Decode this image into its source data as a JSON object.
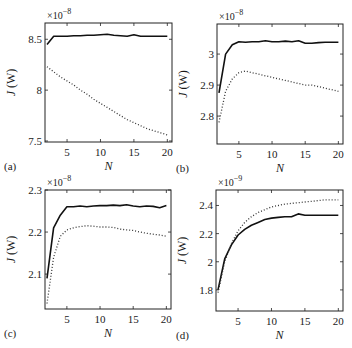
{
  "chart_data": [
    {
      "panel": "(a)",
      "type": "line",
      "xlabel": "N",
      "ylabel": "J (W)",
      "scale_label": "×10^-8",
      "scale_base": "×10",
      "scale_exp": "−8",
      "xlim": [
        1.7,
        20.7
      ],
      "ylim": [
        7.49,
        8.66
      ],
      "xticks": [
        5,
        10,
        15,
        20
      ],
      "yticks": [
        7.5,
        8,
        8.5
      ],
      "ytick_labels": [
        "7.5",
        "8",
        "8.5"
      ],
      "box": [
        45,
        23,
        172,
        142
      ],
      "series": [
        {
          "name": "solid",
          "style": "solid",
          "x": [
            2,
            3,
            4,
            5,
            6,
            7,
            8,
            9,
            10,
            11,
            12,
            13,
            14,
            15,
            16,
            17,
            18,
            19,
            20
          ],
          "values": [
            8.45,
            8.53,
            8.53,
            8.53,
            8.535,
            8.535,
            8.54,
            8.54,
            8.545,
            8.55,
            8.54,
            8.535,
            8.53,
            8.545,
            8.53,
            8.53,
            8.53,
            8.53,
            8.53
          ]
        },
        {
          "name": "dotted",
          "style": "dotted",
          "x": [
            2,
            3,
            4,
            5,
            6,
            7,
            8,
            9,
            10,
            11,
            12,
            13,
            14,
            15,
            16,
            17,
            18,
            19,
            20
          ],
          "values": [
            8.23,
            8.18,
            8.13,
            8.09,
            8.05,
            8.0,
            7.96,
            7.91,
            7.87,
            7.83,
            7.79,
            7.75,
            7.71,
            7.68,
            7.65,
            7.62,
            7.6,
            7.58,
            7.56
          ]
        }
      ]
    },
    {
      "panel": "(b)",
      "type": "line",
      "xlabel": "N",
      "ylabel": "J (W)",
      "scale_label": "×10^-8",
      "scale_base": "×10",
      "scale_exp": "−8",
      "xlim": [
        1.7,
        20.7
      ],
      "ylim": [
        2.71,
        3.097
      ],
      "xticks": [
        5,
        10,
        15,
        20
      ],
      "yticks": [
        2.8,
        2.9,
        3.0
      ],
      "ytick_labels": [
        "2.8",
        "2.9",
        "3"
      ],
      "box": [
        217,
        24,
        343,
        144
      ],
      "series": [
        {
          "name": "solid",
          "style": "solid",
          "x": [
            2,
            3,
            4,
            5,
            6,
            7,
            8,
            9,
            10,
            11,
            12,
            13,
            14,
            15,
            16,
            17,
            18,
            19,
            20
          ],
          "values": [
            2.875,
            3.0,
            3.03,
            3.04,
            3.038,
            3.04,
            3.04,
            3.043,
            3.04,
            3.04,
            3.042,
            3.04,
            3.043,
            3.035,
            3.035,
            3.037,
            3.038,
            3.038,
            3.038
          ]
        },
        {
          "name": "dotted",
          "style": "dotted",
          "x": [
            2,
            3,
            4,
            5,
            6,
            7,
            8,
            9,
            10,
            11,
            12,
            13,
            14,
            15,
            16,
            17,
            18,
            19,
            20
          ],
          "values": [
            2.78,
            2.88,
            2.92,
            2.94,
            2.945,
            2.94,
            2.935,
            2.93,
            2.925,
            2.92,
            2.915,
            2.91,
            2.905,
            2.9,
            2.9,
            2.895,
            2.89,
            2.885,
            2.88
          ]
        }
      ]
    },
    {
      "panel": "(c)",
      "type": "line",
      "xlabel": "N",
      "ylabel": "J (W)",
      "scale_label": "×10^-8",
      "scale_base": "×10",
      "scale_exp": "−8",
      "xlim": [
        1.7,
        20.7
      ],
      "ylim": [
        2.017,
        2.3
      ],
      "xticks": [
        5,
        10,
        15,
        20
      ],
      "yticks": [
        2.1,
        2.2,
        2.3
      ],
      "ytick_labels": [
        "2.1",
        "2.2",
        "2.3"
      ],
      "box": [
        45,
        190,
        171,
        309
      ],
      "series": [
        {
          "name": "solid",
          "style": "solid",
          "x": [
            2,
            3,
            4,
            5,
            6,
            7,
            8,
            9,
            10,
            11,
            12,
            13,
            14,
            15,
            16,
            17,
            18,
            19,
            20
          ],
          "values": [
            2.09,
            2.21,
            2.24,
            2.26,
            2.26,
            2.262,
            2.26,
            2.262,
            2.263,
            2.263,
            2.264,
            2.263,
            2.265,
            2.262,
            2.26,
            2.262,
            2.261,
            2.258,
            2.263
          ]
        },
        {
          "name": "dotted",
          "style": "dotted",
          "x": [
            2,
            3,
            4,
            5,
            6,
            7,
            8,
            9,
            10,
            11,
            12,
            13,
            14,
            15,
            16,
            17,
            18,
            19,
            20
          ],
          "values": [
            2.03,
            2.14,
            2.19,
            2.205,
            2.21,
            2.213,
            2.215,
            2.214,
            2.212,
            2.212,
            2.211,
            2.207,
            2.205,
            2.204,
            2.2,
            2.197,
            2.195,
            2.193,
            2.19
          ]
        }
      ]
    },
    {
      "panel": "(d)",
      "type": "line",
      "xlabel": "N",
      "ylabel": "J (W)",
      "scale_label": "×10^-9",
      "scale_base": "×10",
      "scale_exp": "−9",
      "xlim": [
        1.7,
        20.7
      ],
      "ylim": [
        1.65,
        2.51
      ],
      "xticks": [
        5,
        10,
        15,
        20
      ],
      "yticks": [
        1.8,
        2.0,
        2.2,
        2.4
      ],
      "ytick_labels": [
        "1.8",
        "2",
        "2.2",
        "2.4"
      ],
      "box": [
        216,
        190,
        343,
        311
      ],
      "series": [
        {
          "name": "solid",
          "style": "solid",
          "x": [
            2,
            3,
            4,
            5,
            6,
            7,
            8,
            9,
            10,
            11,
            12,
            13,
            14,
            15,
            16,
            17,
            18,
            19,
            20
          ],
          "values": [
            1.8,
            2.02,
            2.12,
            2.19,
            2.23,
            2.26,
            2.28,
            2.3,
            2.31,
            2.315,
            2.32,
            2.32,
            2.34,
            2.33,
            2.33,
            2.33,
            2.33,
            2.33,
            2.33
          ]
        },
        {
          "name": "dotted",
          "style": "dotted",
          "x": [
            2,
            3,
            4,
            5,
            6,
            7,
            8,
            9,
            10,
            11,
            12,
            13,
            14,
            15,
            16,
            17,
            18,
            19,
            20
          ],
          "values": [
            1.78,
            2.0,
            2.13,
            2.22,
            2.28,
            2.32,
            2.35,
            2.37,
            2.39,
            2.4,
            2.41,
            2.415,
            2.42,
            2.425,
            2.43,
            2.435,
            2.44,
            2.44,
            2.44
          ]
        }
      ]
    }
  ]
}
